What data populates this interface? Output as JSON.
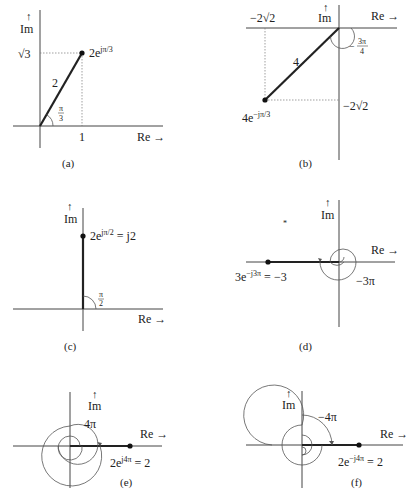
{
  "axes": {
    "re_label": "Re →",
    "im_arrow": "↑",
    "im_label": "Im"
  },
  "panels": {
    "a": {
      "caption": "(a)",
      "point_label_base": "2e",
      "point_label_exp": "jπ/3",
      "magnitude": "2",
      "angle_num": "π",
      "angle_den": "3",
      "y_tick": "√3",
      "x_tick": "1"
    },
    "b": {
      "caption": "(b)",
      "point_label_base": "4e",
      "point_label_exp": "−jπ/3",
      "magnitude": "4",
      "angle_num": "3π",
      "angle_den": "4",
      "angle_sign": "−",
      "x_tick": "−2√2",
      "y_tick": "−2√2"
    },
    "c": {
      "caption": "(c)",
      "point_label_base": "2e",
      "point_label_exp": "jπ/2",
      "point_label_tail": " = j2",
      "angle_num": "π",
      "angle_den": "2"
    },
    "d": {
      "caption": "(d)",
      "point_label_base": "3e",
      "point_label_exp": "−j3π",
      "point_label_tail": " = −3",
      "angle_label": "−3π"
    },
    "e": {
      "caption": "(e)",
      "point_label_base": "2e",
      "point_label_exp": "j4π",
      "point_label_tail": " = 2",
      "angle_label": "4π"
    },
    "f": {
      "caption": "(f)",
      "point_label_base": "2e",
      "point_label_exp": "−j4π",
      "point_label_tail": " = 2",
      "angle_label": "−4π"
    }
  }
}
